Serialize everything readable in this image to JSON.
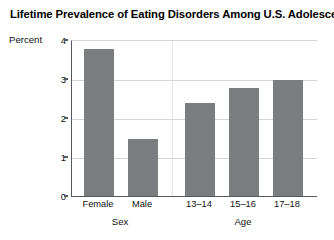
{
  "chart_data": {
    "type": "bar",
    "title": "Lifetime Prevalence of Eating Disorders Among U.S. Adolescents",
    "xlabel": "",
    "ylabel": "Percent",
    "ylim": [
      0,
      4
    ],
    "yticks": [
      0,
      1,
      2,
      3,
      4
    ],
    "ytick_labels": [
      "0",
      "1",
      "2",
      "3",
      "4"
    ],
    "grid": true,
    "legend": "none",
    "categories": [
      "Female",
      "Male",
      "13–14",
      "15–16",
      "17–18"
    ],
    "values": [
      3.8,
      1.5,
      2.4,
      2.8,
      3.0
    ],
    "groups": [
      {
        "label": "Sex",
        "categories": [
          "Female",
          "Male"
        ],
        "values": [
          3.8,
          1.5
        ]
      },
      {
        "label": "Age",
        "categories": [
          "13–14",
          "15–16",
          "17–18"
        ],
        "values": [
          2.4,
          2.8,
          3.0
        ]
      }
    ],
    "bar_color": "#7b7e81",
    "axis_color": "#55585c",
    "grid_color": "#d2d4d6",
    "background": "#ffffff"
  },
  "axis": {
    "y_label": "Percent",
    "ticks": [
      {
        "value": 4,
        "label": "4"
      },
      {
        "value": 3,
        "label": "3"
      },
      {
        "value": 2,
        "label": "2"
      },
      {
        "value": 1,
        "label": "1"
      },
      {
        "value": 0,
        "label": "0"
      }
    ]
  },
  "bars": [
    {
      "label": "Female",
      "value": 3.8,
      "group": "Sex"
    },
    {
      "label": "Male",
      "value": 1.5,
      "group": "Sex"
    },
    {
      "label": "13–14",
      "value": 2.4,
      "group": "Age"
    },
    {
      "label": "15–16",
      "value": 2.8,
      "group": "Age"
    },
    {
      "label": "17–18",
      "value": 3.0,
      "group": "Age"
    }
  ],
  "group_labels": [
    {
      "label": "Sex"
    },
    {
      "label": "Age"
    }
  ]
}
